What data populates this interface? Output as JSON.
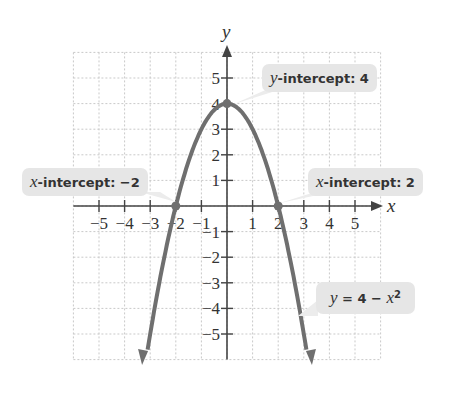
{
  "chart_data": {
    "type": "line",
    "title": "",
    "equation": "y = 4 − x²",
    "xlabel": "x",
    "ylabel": "y",
    "xlim": [
      -6,
      6
    ],
    "ylim": [
      -6,
      6
    ],
    "grid": true,
    "x_ticks": [
      -5,
      -4,
      -3,
      -2,
      -1,
      1,
      2,
      3,
      4,
      5
    ],
    "y_ticks": [
      5,
      4,
      3,
      2,
      1,
      -1,
      -2,
      -3,
      -4,
      -5
    ],
    "series": [
      {
        "name": "y = 4 - x^2",
        "x": [
          -3.2,
          -3,
          -2,
          -1,
          0,
          1,
          2,
          3,
          3.2
        ],
        "y": [
          -6.24,
          -5,
          0,
          3,
          4,
          3,
          0,
          -5,
          -6.24
        ]
      }
    ],
    "points": [
      {
        "x": -2,
        "y": 0
      },
      {
        "x": 0,
        "y": 4
      },
      {
        "x": 2,
        "y": 0
      }
    ],
    "annotations": [
      {
        "label": "y-intercept: 4"
      },
      {
        "label": "x-intercept: −2"
      },
      {
        "label": "x-intercept: 2"
      },
      {
        "label": "y = 4 − x²"
      }
    ]
  },
  "labels": {
    "y_intercept_var": "y",
    "y_intercept_text": "-intercept: 4",
    "x_intercept_left_var": "x",
    "x_intercept_left_text": "-intercept: −2",
    "x_intercept_right_var": "x",
    "x_intercept_right_text": "-intercept: 2",
    "eq_y": "y",
    "eq_mid": " = 4 − ",
    "eq_x": "x",
    "eq_sup": "2",
    "x_axis": "x",
    "y_axis": "y"
  }
}
